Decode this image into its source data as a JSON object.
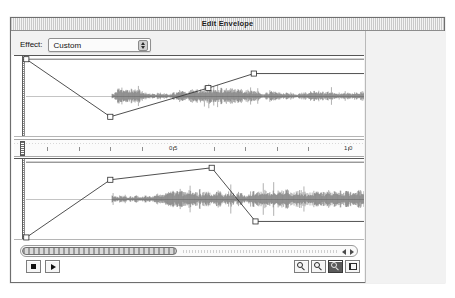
{
  "window": {
    "title": "Edit Envelope"
  },
  "effect": {
    "label": "Effect:",
    "value": "Custom",
    "options": [
      "Custom"
    ],
    "stepper_icon": "stepper-arrows-icon"
  },
  "buttons": {
    "ok": "OK",
    "cancel": "Cancel"
  },
  "timeline": {
    "ticks": [
      {
        "pos_pct": 9.5,
        "label": ""
      },
      {
        "pos_pct": 18.5,
        "label": ""
      },
      {
        "pos_pct": 27.5,
        "label": ""
      },
      {
        "pos_pct": 36.5,
        "label": ""
      },
      {
        "pos_pct": 45.5,
        "label": "0.5"
      },
      {
        "pos_pct": 57.0,
        "label": ""
      },
      {
        "pos_pct": 66.0,
        "label": ""
      },
      {
        "pos_pct": 75.0,
        "label": ""
      },
      {
        "pos_pct": 84.0,
        "label": ""
      },
      {
        "pos_pct": 95.5,
        "label": "1.0"
      }
    ],
    "start_label": "0.5",
    "end_label": "1.0"
  },
  "transport": {
    "stop": "stop-button",
    "play": "play-button"
  },
  "zoom_tools": {
    "zoom_in": "zoom-in",
    "zoom_out": "zoom-out",
    "zoom_selection": "zoom-selection",
    "zoom_fit": "zoom-fit",
    "active": "zoom-selection"
  },
  "scrollbar": {
    "thumb_pct": 46,
    "left_arrow": "scroll-left",
    "right_arrow": "scroll-right"
  },
  "chart_data": {
    "type": "line",
    "title": "Edit Envelope",
    "xlabel": "Time (s)",
    "ylabel": "Amplitude",
    "xlim": [
      0,
      1.0
    ],
    "ylim": [
      0,
      1.0
    ],
    "grid": false,
    "legend": "none",
    "panels": [
      {
        "name": "top-channel-envelope",
        "waveform": {
          "start_pct": 28,
          "end_pct": 100,
          "amplitude": 0.16,
          "color": "#4d4d4d"
        },
        "envelope": {
          "color": "#3a3a3a",
          "handle_fill": "#ffffff",
          "handle_stroke": "#2b2b2b",
          "points": [
            {
              "x_pct": 3.5,
              "y_pct": 4
            },
            {
              "x_pct": 27.5,
              "y_pct": 76
            },
            {
              "x_pct": 55.5,
              "y_pct": 40
            },
            {
              "x_pct": 68.5,
              "y_pct": 22
            },
            {
              "x_pct": 100,
              "y_pct": 22
            }
          ]
        },
        "ceiling_line_y_pct": 4
      },
      {
        "name": "bottom-channel-envelope",
        "waveform": {
          "start_pct": 28,
          "end_pct": 100,
          "amplitude": 0.18,
          "color": "#4d4d4d"
        },
        "envelope": {
          "color": "#3a3a3a",
          "handle_fill": "#ffffff",
          "handle_stroke": "#2b2b2b",
          "points": [
            {
              "x_pct": 3.5,
              "y_pct": 98
            },
            {
              "x_pct": 27.5,
              "y_pct": 26
            },
            {
              "x_pct": 56.5,
              "y_pct": 11
            },
            {
              "x_pct": 69.0,
              "y_pct": 78
            },
            {
              "x_pct": 100,
              "y_pct": 78
            }
          ]
        },
        "ceiling_line_y_pct": 4
      }
    ]
  }
}
